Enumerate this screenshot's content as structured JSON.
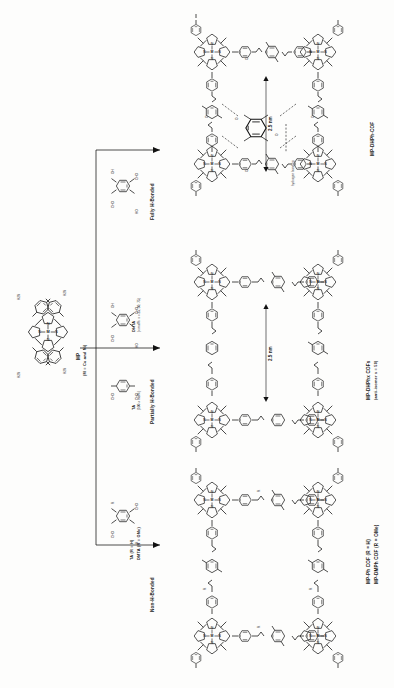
{
  "figure": {
    "type": "reaction-scheme",
    "orientation": "rotated-90-ccw"
  },
  "reactant": {
    "name": "MP",
    "sub_label": "(M = Cu and Ni)",
    "core_atoms": [
      "N",
      "N",
      "N",
      "N",
      "M"
    ],
    "substituent": "NH2",
    "substituent_count": 4
  },
  "pathways": [
    {
      "id": "fully-h-bonded",
      "outcome_label": "Fully H-Bonded",
      "reagents": [
        {
          "name": "DHTA",
          "groups": [
            "CHO",
            "CHO",
            "HO",
            "OH"
          ]
        }
      ],
      "product_label": "MP-DHPh-COF",
      "pore_size": "2.5 nm",
      "annotation": "hydrogen bonding"
    },
    {
      "id": "partially-h-bonded",
      "outcome_label": "Partially H-Bonded",
      "reagents": [
        {
          "name": "DHTA",
          "stoich": "(x mol%: x = 25, 50, 75)",
          "groups": [
            "CHO",
            "CHO",
            "HO",
            "OH"
          ]
        },
        {
          "name": "TA",
          "stoich": "(100-x mol%)",
          "groups": [
            "CHO",
            "CHO"
          ]
        }
      ],
      "product_label": "MP-DHPhx COFs",
      "product_sub_label": "(anti-isomer x = 50)",
      "pore_size": "2.5 nm"
    },
    {
      "id": "non-h-bonded",
      "outcome_label": "Non-H-Bonded",
      "reagents": [
        {
          "name": "TA (R = H)",
          "groups": [
            "CHO",
            "CHO",
            "R",
            "R"
          ]
        },
        {
          "name": "DMTA (R = OMe)",
          "groups": []
        }
      ],
      "product_label": "MP-Ph COF (R = H)",
      "product_sub_label": "MP-DMPh COF (R = OMe)"
    }
  ],
  "atoms": {
    "N": "N",
    "M": "M",
    "O": "O",
    "H": "H",
    "R": "R",
    "NH2": "H2N",
    "CHO": "CHO",
    "OH": "OH",
    "HO": "HO",
    "OMe": "OMe"
  },
  "colors": {
    "stroke": "#111111",
    "background": "#fdfdfc",
    "text": "#1a1a1a"
  }
}
